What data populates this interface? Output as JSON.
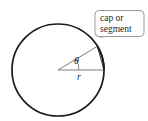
{
  "figure": {
    "callout": {
      "line1": "cap or",
      "line2": "segment",
      "box_stroke": "#9a9a9a",
      "box_fill": "#ffffff",
      "text_color": "#2a2a2a"
    },
    "labels": {
      "angle": "θ",
      "radius": "r"
    },
    "colors": {
      "circle_stroke": "#1b1b1b",
      "sector_stroke": "#6e6e6e",
      "chord_stroke": "#3a3a3a",
      "leader_stroke": "#6e6e6e",
      "background": "#ffffff"
    },
    "geometry": {
      "center_x": 58,
      "center_y": 70,
      "radius": 46,
      "angle_degrees": 31,
      "circle_stroke_width": 1.6,
      "sector_stroke_width": 0.8
    }
  }
}
